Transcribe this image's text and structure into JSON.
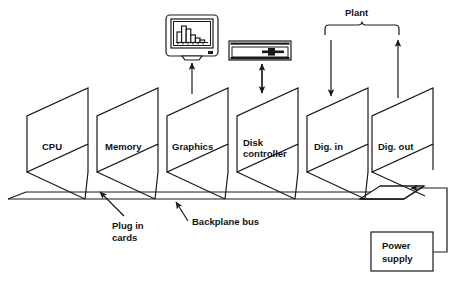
{
  "diagram": {
    "stroke_color": "#1a1a1a",
    "background_color": "#ffffff",
    "cards": [
      {
        "id": "cpu",
        "label": "CPU",
        "label_line2": ""
      },
      {
        "id": "memory",
        "label": "Memory",
        "label_line2": ""
      },
      {
        "id": "graphics",
        "label": "Graphics",
        "label_line2": ""
      },
      {
        "id": "disk-controller",
        "label": "Disk",
        "label_line2": "controller"
      },
      {
        "id": "dig-in",
        "label": "Dig. in",
        "label_line2": ""
      },
      {
        "id": "dig-out",
        "label": "Dig. out",
        "label_line2": ""
      }
    ],
    "peripherals": {
      "monitor": {
        "name": "crt-monitor-icon",
        "chart_bars": [
          10,
          16,
          13,
          7,
          4,
          2
        ]
      },
      "disk_drive": {
        "name": "disk-drive-icon"
      }
    },
    "annotations": {
      "plant": "Plant",
      "plug_in_cards_line1": "Plug in",
      "plug_in_cards_line2": "cards",
      "backplane_bus": "Backplane bus",
      "power_supply_line1": "Power",
      "power_supply_line2": "supply"
    },
    "connections": [
      {
        "from": "graphics",
        "to": "monitor",
        "direction": "up",
        "arrow": "single"
      },
      {
        "from": "disk-controller",
        "to": "disk_drive",
        "direction": "bidirectional",
        "arrow": "double"
      },
      {
        "from": "plant",
        "to": "dig-in",
        "direction": "down",
        "arrow": "single"
      },
      {
        "from": "dig-out",
        "to": "plant",
        "direction": "up",
        "arrow": "single"
      },
      {
        "from": "power-supply",
        "to": "backplane-bus",
        "direction": "left",
        "arrow": "single"
      }
    ]
  }
}
